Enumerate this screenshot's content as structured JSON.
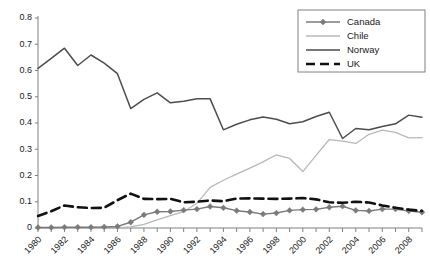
{
  "chart_data": {
    "type": "line",
    "title": "",
    "xlabel": "",
    "ylabel": "",
    "xlim": [
      1980,
      2009
    ],
    "ylim": [
      0,
      0.8
    ],
    "grid": false,
    "legend_position": "top-right",
    "x": [
      1980,
      1981,
      1982,
      1983,
      1984,
      1985,
      1986,
      1987,
      1988,
      1989,
      1990,
      1991,
      1992,
      1993,
      1994,
      1995,
      1996,
      1997,
      1998,
      1999,
      2000,
      2001,
      2002,
      2003,
      2004,
      2005,
      2006,
      2007,
      2008,
      2009
    ],
    "x_tick_labels": [
      "1980",
      "1982",
      "1984",
      "1986",
      "1988",
      "1990",
      "1992",
      "1994",
      "1996",
      "1998",
      "2000",
      "2002",
      "2004",
      "2006",
      "2008"
    ],
    "y_tick_labels": [
      "0",
      "0.1",
      "0.2",
      "0.3",
      "0.4",
      "0.5",
      "0.6",
      "0.7",
      "0.8"
    ],
    "y_ticks": [
      0,
      0.1,
      0.2,
      0.3,
      0.4,
      0.5,
      0.6,
      0.7,
      0.8
    ],
    "series": [
      {
        "name": "Canada",
        "color": "#7a7a7a",
        "style": "solid-marker",
        "marker": "diamond",
        "width": 1.4,
        "values": [
          0.002,
          0.002,
          0.003,
          0.003,
          0.003,
          0.004,
          0.006,
          0.022,
          0.05,
          0.062,
          0.063,
          0.068,
          0.072,
          0.082,
          0.077,
          0.066,
          0.061,
          0.053,
          0.057,
          0.067,
          0.07,
          0.071,
          0.079,
          0.083,
          0.067,
          0.065,
          0.072,
          0.072,
          0.065,
          0.06
        ]
      },
      {
        "name": "Chile",
        "color": "#b8b8b8",
        "style": "solid",
        "marker": "none",
        "width": 1.3,
        "values": [
          0.0,
          0.0,
          0.0,
          0.0,
          0.0,
          0.0,
          0.0,
          0.004,
          0.014,
          0.031,
          0.047,
          0.062,
          0.094,
          0.155,
          0.182,
          0.205,
          0.228,
          0.252,
          0.279,
          0.265,
          0.215,
          0.277,
          0.337,
          0.331,
          0.322,
          0.357,
          0.373,
          0.364,
          0.343,
          0.344
        ]
      },
      {
        "name": "Norway",
        "color": "#4d4d4d",
        "style": "solid",
        "marker": "none",
        "width": 1.5,
        "values": [
          0.608,
          0.646,
          0.685,
          0.619,
          0.659,
          0.628,
          0.588,
          0.455,
          0.49,
          0.515,
          0.477,
          0.483,
          0.492,
          0.492,
          0.374,
          0.395,
          0.412,
          0.423,
          0.414,
          0.397,
          0.405,
          0.425,
          0.441,
          0.341,
          0.379,
          0.374,
          0.387,
          0.397,
          0.43,
          0.422
        ]
      },
      {
        "name": "UK",
        "color": "#111111",
        "style": "dashed",
        "marker": "none",
        "width": 2.6,
        "values": [
          0.046,
          0.064,
          0.086,
          0.079,
          0.076,
          0.077,
          0.106,
          0.131,
          0.111,
          0.11,
          0.111,
          0.098,
          0.1,
          0.105,
          0.102,
          0.112,
          0.113,
          0.112,
          0.111,
          0.112,
          0.114,
          0.109,
          0.098,
          0.096,
          0.1,
          0.097,
          0.086,
          0.077,
          0.07,
          0.065
        ]
      }
    ]
  },
  "legend": {
    "entries": [
      {
        "label": "Canada"
      },
      {
        "label": "Chile"
      },
      {
        "label": "Norway"
      },
      {
        "label": "UK"
      }
    ]
  }
}
